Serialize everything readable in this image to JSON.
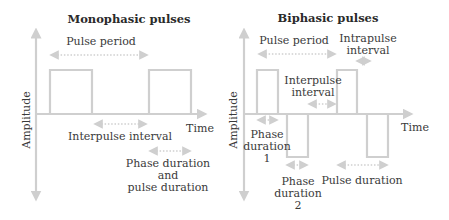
{
  "colors": {
    "stroke": "#cfcfcf",
    "text": "#3a3a3a"
  },
  "monophasic": {
    "title": "Monophasic pulses",
    "y_axis_label": "Amplitude",
    "x_axis_label": "Time",
    "pulse_period_label": "Pulse period",
    "interpulse_interval_label": "Interpulse interval",
    "phase_duration_lines": [
      "Phase duration",
      "and",
      "pulse duration"
    ]
  },
  "biphasic": {
    "title": "Biphasic pulses",
    "y_axis_label": "Amplitude",
    "x_axis_label": "Time",
    "pulse_period_label": "Pulse period",
    "intrapulse_interval_lines": [
      "Intrapulse",
      "interval"
    ],
    "interpulse_interval_lines": [
      "Interpulse",
      "interval"
    ],
    "phase_duration_1_lines": [
      "Phase",
      "duration",
      "1"
    ],
    "phase_duration_2_lines": [
      "Phase",
      "duration",
      "2"
    ],
    "pulse_duration_label": "Pulse duration"
  }
}
